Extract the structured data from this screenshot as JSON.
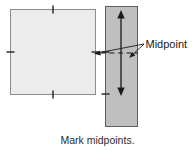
{
  "figure": {
    "type": "instructional-diagram",
    "caption": "Mark midpoints.",
    "annotations": {
      "midpoint_label": "Midpoint"
    },
    "shapes": {
      "square": {
        "name": "light-square",
        "fill": "#ececec",
        "stroke": "#8a8a8a",
        "x": 10,
        "y": 9,
        "width": 85,
        "height": 85,
        "tick_marks": [
          "top-midpoint",
          "left-midpoint",
          "right-midpoint",
          "bottom-midpoint"
        ],
        "tick_color": "#3a3a3a"
      },
      "strip": {
        "name": "gray-strip",
        "fill": "#bfbfbf",
        "stroke": "#5a5a5a",
        "x": 105,
        "y": 6,
        "width": 32,
        "height": 121
      }
    },
    "arrow": {
      "name": "double-headed-vertical-arrow",
      "color": "#1a1a1a",
      "x": 121,
      "y_top": 11,
      "y_bottom": 95
    },
    "dashed_midline": {
      "name": "midpoint-dashed-line",
      "color": "#1a1a1a",
      "y": 53,
      "x_start": 101,
      "x_end": 137
    },
    "leader_lines": [
      {
        "name": "leader-to-square-tick",
        "from_x": 143,
        "from_y": 45,
        "to_x": 96,
        "to_y": 53
      },
      {
        "name": "leader-to-strip-dashline",
        "from_x": 143,
        "from_y": 45,
        "to_x": 131,
        "to_y": 56
      }
    ]
  }
}
